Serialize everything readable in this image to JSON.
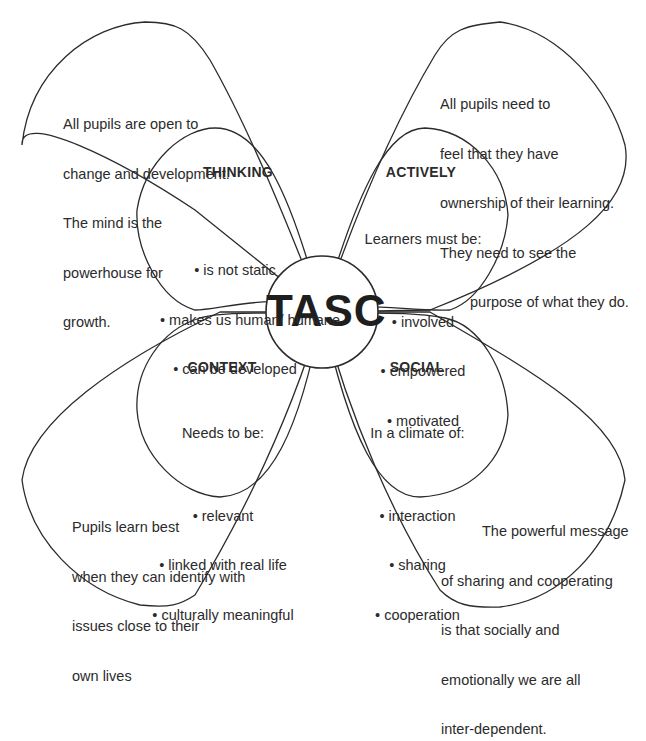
{
  "core": {
    "label": "TASC"
  },
  "colors": {
    "stroke": "#2b2b2b",
    "text": "#2b2b2b",
    "background": "#ffffff"
  },
  "petals": [
    {
      "id": "thinking",
      "title": "THINKING",
      "intro": "",
      "bullets": [
        "is not static",
        "makes us human/ humane",
        "can be developed"
      ],
      "outer_text": [
        "All pupils are open to",
        "change and development.",
        "The mind is the",
        "powerhouse for",
        "growth."
      ]
    },
    {
      "id": "actively",
      "title": "ACTIVELY",
      "intro": "Learners must be:",
      "bullets": [
        "involved",
        "empowered",
        "motivated"
      ],
      "outer_text": [
        "All pupils need to",
        "feel that they have",
        "ownership of their learning.",
        "They need to see the",
        "purpose of what they do."
      ]
    },
    {
      "id": "context",
      "title": "CONTEXT",
      "intro": "Needs to be:",
      "bullets": [
        "relevant",
        "linked with real life",
        "culturally meaningful"
      ],
      "outer_text": [
        "Pupils learn best",
        "when they can identify with",
        "issues close to their",
        "own lives"
      ]
    },
    {
      "id": "social",
      "title": "SOCIAL",
      "intro": "In a climate of:",
      "bullets": [
        "interaction",
        "sharing",
        "cooperation"
      ],
      "outer_text": [
        "The powerful message",
        "of sharing and cooperating",
        "is that socially and",
        "emotionally we are all",
        "inter-dependent."
      ]
    }
  ]
}
